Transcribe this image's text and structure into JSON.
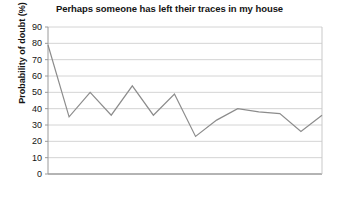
{
  "chart_data": {
    "type": "line",
    "title": "Perhaps someone has left their traces in my house",
    "xlabel": "",
    "ylabel": "Probability of doubt (%)",
    "ylim": [
      0,
      90
    ],
    "yticks": [
      0,
      10,
      20,
      30,
      40,
      50,
      60,
      70,
      80,
      90
    ],
    "xticks": [],
    "xticklabels": [],
    "grid": true,
    "legend": false,
    "series": [
      {
        "name": "Probability of doubt",
        "color": "#8c8c8c",
        "x": [
          1,
          2,
          3,
          4,
          5,
          6,
          7,
          8,
          9,
          10,
          11,
          12,
          13,
          14
        ],
        "values": [
          79,
          35,
          50,
          36,
          54,
          36,
          49,
          23,
          33,
          40,
          38,
          37,
          26,
          36
        ]
      }
    ]
  },
  "style": {
    "line_color": "#8c8c8c",
    "grid_color": "#d4d4d4",
    "axis_color": "#9a9a9a",
    "text_color": "#141414",
    "background": "#ffffff"
  },
  "axis": {
    "y_min_label": "0",
    "y_max_label": "90"
  }
}
